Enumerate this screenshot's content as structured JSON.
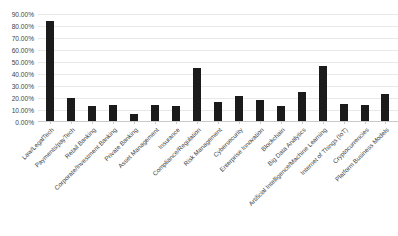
{
  "chart_data": {
    "type": "bar",
    "title": "",
    "xlabel": "",
    "ylabel": "",
    "ylim": [
      0,
      0.9
    ],
    "grid": true,
    "legend": false,
    "bar_color": "#1b1b1b",
    "gridline_color": "#e8e8e8",
    "y_tick_labels": [
      "90.00%",
      "80.00%",
      "70.00%",
      "60.00%",
      "50.00%",
      "40.00%",
      "30.00%",
      "20.00%",
      "10.00%",
      "0.00%"
    ],
    "y_tick_values": [
      0.9,
      0.8,
      0.7,
      0.6,
      0.5,
      0.4,
      0.3,
      0.2,
      0.1,
      0.0
    ],
    "categories": [
      "Law/LegalTech",
      "Payments/payTech",
      "Retail Banking",
      "Corporate/Investment Banking",
      "Private Banking",
      "Asset Management",
      "Insurance",
      "Compliance/Regulation",
      "Risk Management",
      "Cybersecurity",
      "Enterprise Innovation",
      "Blockchain",
      "Big Data Analytics",
      "Artificial Intelligence/Machine Learning",
      "Internet of Things (IoT)",
      "Cryptocurrencies",
      "Platform Business Models"
    ],
    "values": [
      0.84,
      0.2,
      0.13,
      0.14,
      0.07,
      0.14,
      0.13,
      0.45,
      0.17,
      0.22,
      0.18,
      0.13,
      0.25,
      0.47,
      0.15,
      0.14,
      0.23
    ]
  }
}
